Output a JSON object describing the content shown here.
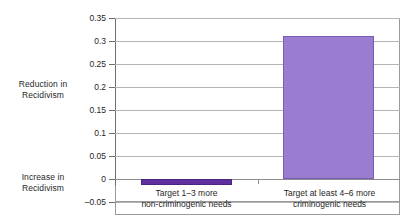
{
  "annotations": {
    "reduction_note": "Reduction in\nRecidivism",
    "increase_note": "Increase in\nRecidivism"
  },
  "chart_data": {
    "type": "bar",
    "title": "",
    "xlabel": "",
    "ylabel": "",
    "categories": [
      "Target 1–3 more\nnon-criminogenic needs",
      "Target at least 4–6 more\ncriminogenic needs"
    ],
    "values": [
      -0.012,
      0.31
    ],
    "ylim": [
      -0.05,
      0.35
    ],
    "yticks": [
      -0.05,
      0,
      0.05,
      0.1,
      0.15,
      0.2,
      0.25,
      0.3,
      0.35
    ],
    "ytick_labels": [
      "–0.05",
      "0",
      "0.05",
      "0.1",
      "0.15",
      "0.2",
      "0.25",
      "0.3",
      "0.35"
    ],
    "grid": true,
    "legend": "none",
    "bar_colors": [
      "#5f2f9e",
      "#9a7cd0"
    ],
    "bar_border_colors": [
      "#4a2580",
      "#7a5cb0"
    ],
    "zero_line": 0,
    "axis_color": "#6e6e6e",
    "gridline_color": "#b4b4b4",
    "background": "#ffffff",
    "text_color": "#1f1f1f",
    "annotation_labels": [
      "Reduction in Recidivism",
      "Increase in Recidivism"
    ]
  }
}
